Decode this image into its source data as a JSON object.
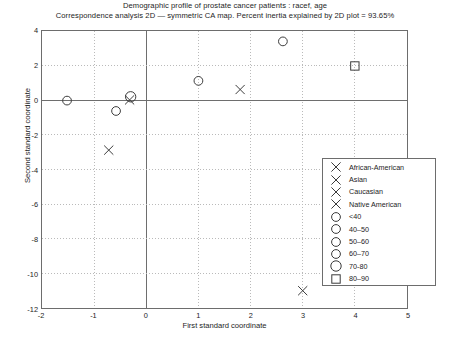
{
  "chart_data": {
    "type": "scatter",
    "title": "Demographic profile of prostate cancer patients : racef, age",
    "subtitle": "Correspondence analysis 2D — symmetric CA map. Percent inertia explained by 2D plot = 93.65%",
    "xlabel": "First standard coordinate",
    "ylabel": "Second standard coordinate",
    "xlim": [
      -2,
      5
    ],
    "ylim": [
      -12,
      4
    ],
    "xticks": [
      "-2",
      "-1",
      "0",
      "1",
      "2",
      "3",
      "4",
      "5"
    ],
    "xtick_values": [
      -2,
      -1,
      0,
      1,
      2,
      3,
      4,
      5
    ],
    "yticks": [
      "-12",
      "-10",
      "-8",
      "-6",
      "-4",
      "-2",
      "0",
      "2",
      "4"
    ],
    "ytick_values": [
      -12,
      -10,
      -8,
      -6,
      -4,
      -2,
      0,
      2,
      4
    ],
    "grid": "dotted",
    "legend_position": "right-inside",
    "marker_color": "#3a3a3a",
    "axis_color": "#6d6d6d",
    "grid_color": "#b9b9b9",
    "series": [
      {
        "name": "African-American",
        "marker": "x",
        "size": 4.6,
        "points": [
          {
            "x": 1.8,
            "y": 0.62
          }
        ]
      },
      {
        "name": "Asian",
        "marker": "x",
        "size": 4.6,
        "points": [
          {
            "x": 3.0,
            "y": -11.0
          }
        ]
      },
      {
        "name": "Caucasian",
        "marker": "x",
        "size": 4.6,
        "points": [
          {
            "x": -0.32,
            "y": 0.02
          }
        ]
      },
      {
        "name": "Native American",
        "marker": "x",
        "size": 4.6,
        "points": [
          {
            "x": -0.72,
            "y": -2.88
          }
        ]
      },
      {
        "name": "<40",
        "marker": "o",
        "size": 4.4,
        "points": [
          {
            "x": -1.52,
            "y": -0.02
          }
        ]
      },
      {
        "name": "40–50",
        "marker": "o",
        "size": 4.4,
        "points": [
          {
            "x": 2.62,
            "y": 3.4
          }
        ]
      },
      {
        "name": "50–60",
        "marker": "o",
        "size": 4.4,
        "points": [
          {
            "x": 1.0,
            "y": 1.12
          }
        ]
      },
      {
        "name": "60–70",
        "marker": "o",
        "size": 4.4,
        "points": [
          {
            "x": -0.58,
            "y": -0.62
          }
        ]
      },
      {
        "name": "70-80",
        "marker": "o",
        "size": 5.2,
        "points": [
          {
            "x": -0.3,
            "y": 0.2
          }
        ]
      },
      {
        "name": "80–90",
        "marker": "s",
        "size": 4.2,
        "points": [
          {
            "x": 4.0,
            "y": 1.98
          }
        ]
      }
    ]
  }
}
